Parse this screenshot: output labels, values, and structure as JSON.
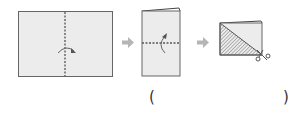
{
  "diagram": {
    "steps": [
      {
        "id": 1,
        "description": "Fold sheet in half along vertical dashed line",
        "fold_line": "vertical"
      },
      {
        "id": 2,
        "description": "Fold in half along horizontal dashed line",
        "fold_line": "horizontal"
      },
      {
        "id": 3,
        "description": "Cut along diagonal; shaded triangle removed",
        "tool": "scissors-icon"
      }
    ],
    "arrows": [
      "arrow-right-icon",
      "arrow-right-icon"
    ],
    "answer": {
      "open_paren": "(",
      "close_paren": ")",
      "value": ""
    },
    "colors": {
      "paper": "#ececec",
      "border": "#666666",
      "dash": "#555555",
      "arrow": "#b5b5b5",
      "hatch": "#777777"
    }
  }
}
